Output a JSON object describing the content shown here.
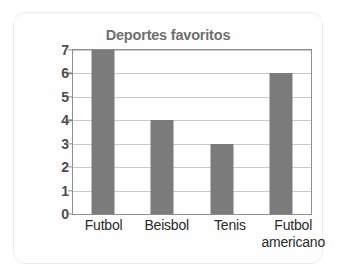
{
  "chart_data": {
    "type": "bar",
    "title": "Deportes favoritos",
    "xlabel": "",
    "ylabel": "Número de estudiantes",
    "categories": [
      "Futbol",
      "Beisbol",
      "Tenis",
      "Futbol americano"
    ],
    "category_lines": [
      [
        "Futbol"
      ],
      [
        "Beisbol"
      ],
      [
        "Tenis"
      ],
      [
        "Futbol",
        "americano"
      ]
    ],
    "values": [
      7,
      4,
      3,
      6
    ],
    "ylim": [
      0,
      7
    ],
    "ytick_labels": [
      "0",
      "1",
      "2",
      "3",
      "4",
      "5",
      "6",
      "7"
    ],
    "ytick_values": [
      0,
      1,
      2,
      3,
      4,
      5,
      6,
      7
    ],
    "grid": true,
    "legend": false,
    "colors": {
      "bar": "#7b7b7b",
      "title": "#6f6f6f",
      "ylabel": "#1c1c1c",
      "ytick": "#4d4d4d",
      "xtick": "#2a2a2a",
      "gridline": "#c9c9c9",
      "axis": "#8f8f8f",
      "plot_background": "#ffffff",
      "card_background": "#fefefe",
      "card_border": "#ededed"
    }
  }
}
